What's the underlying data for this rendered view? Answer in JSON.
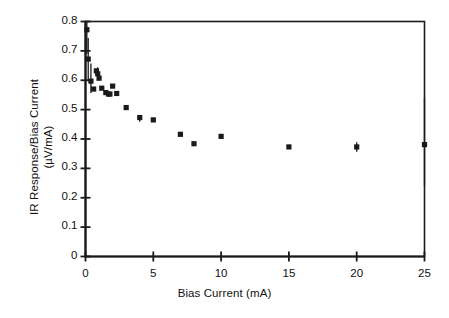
{
  "chart_data": {
    "type": "scatter",
    "title": "",
    "xlabel": "Bias Current (mA)",
    "ylabel": "IR Response/Bias Current (µV/mA)",
    "ylabel_line1": "IR Response/Bias Current",
    "ylabel_line2": "(µV/mA)",
    "xlim": [
      0,
      25
    ],
    "ylim": [
      0,
      0.8
    ],
    "xticks": [
      0,
      5,
      10,
      15,
      20,
      25
    ],
    "xtick_labels": [
      "0",
      "5",
      "10",
      "15",
      "20",
      "25"
    ],
    "yticks": [
      0,
      0.1,
      0.2,
      0.3,
      0.4,
      0.5,
      0.6,
      0.7,
      0.8
    ],
    "ytick_labels": [
      "0",
      "0.1",
      "0.2",
      "0.3",
      "0.4",
      "0.5",
      "0.6",
      "0.7",
      "0.8"
    ],
    "grid": false,
    "legend": null,
    "legend_position": "none",
    "marker": "square",
    "marker_color": "#1a1a1a",
    "marker_size": 4,
    "frame": true,
    "x": [
      0.1,
      0.2,
      0.4,
      0.6,
      0.8,
      0.9,
      1.0,
      1.2,
      1.5,
      1.7,
      1.8,
      2.0,
      2.3,
      3.0,
      4.0,
      5.0,
      7.0,
      8.0,
      10.0,
      15.0,
      20.0,
      25.0
    ],
    "y": [
      0.772,
      0.672,
      0.597,
      0.57,
      0.632,
      0.622,
      0.607,
      0.573,
      0.558,
      0.553,
      0.553,
      0.58,
      0.555,
      0.507,
      0.473,
      0.465,
      0.416,
      0.384,
      0.409,
      0.373,
      0.373,
      0.381
    ],
    "points": [
      {
        "x": 0.1,
        "y": 0.772
      },
      {
        "x": 0.2,
        "y": 0.672
      },
      {
        "x": 0.4,
        "y": 0.597
      },
      {
        "x": 0.6,
        "y": 0.57
      },
      {
        "x": 0.8,
        "y": 0.632
      },
      {
        "x": 0.9,
        "y": 0.622
      },
      {
        "x": 1.0,
        "y": 0.607
      },
      {
        "x": 1.2,
        "y": 0.573
      },
      {
        "x": 1.5,
        "y": 0.558
      },
      {
        "x": 1.7,
        "y": 0.553
      },
      {
        "x": 1.8,
        "y": 0.553
      },
      {
        "x": 2.0,
        "y": 0.58
      },
      {
        "x": 2.3,
        "y": 0.555
      },
      {
        "x": 3.0,
        "y": 0.507
      },
      {
        "x": 4.0,
        "y": 0.473
      },
      {
        "x": 5.0,
        "y": 0.465
      },
      {
        "x": 7.0,
        "y": 0.416
      },
      {
        "x": 8.0,
        "y": 0.384
      },
      {
        "x": 10.0,
        "y": 0.409
      },
      {
        "x": 15.0,
        "y": 0.373
      },
      {
        "x": 20.0,
        "y": 0.373
      },
      {
        "x": 25.0,
        "y": 0.381
      }
    ],
    "error_bars": [
      {
        "x": 0.1,
        "y": 0.772,
        "yerr_low": 0.082,
        "yerr_high": 0.028
      },
      {
        "x": 0.2,
        "y": 0.672,
        "yerr_low": 0.072,
        "yerr_high": 0.072
      },
      {
        "x": 0.4,
        "y": 0.597,
        "yerr_low": 0.04,
        "yerr_high": 0.06
      },
      {
        "x": 0.9,
        "y": 0.622,
        "yerr_low": 0.022,
        "yerr_high": 0.022
      },
      {
        "x": 4.0,
        "y": 0.473,
        "yerr_low": 0.014,
        "yerr_high": 0.0
      },
      {
        "x": 20.0,
        "y": 0.373,
        "yerr_low": 0.016,
        "yerr_high": 0.016
      },
      {
        "x": 25.0,
        "y": 0.381,
        "yerr_low": 0.14,
        "yerr_high": 0.16
      }
    ]
  }
}
